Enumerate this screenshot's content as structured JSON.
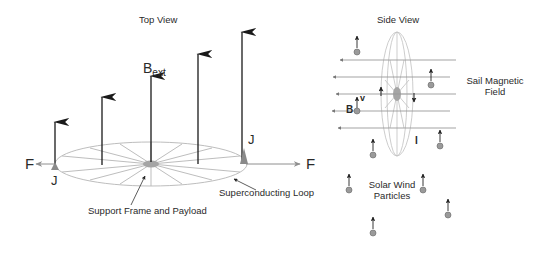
{
  "top_view": {
    "title": "Top View",
    "field_label_main": "B",
    "field_label_sub": "ext",
    "force_left": "F",
    "force_right": "F",
    "current_left": "J",
    "current_right": "J",
    "support_label": "Support Frame and Payload",
    "loop_label": "Superconducting Loop"
  },
  "side_view": {
    "title": "Side View",
    "field_label_line1": "Sail Magnetic",
    "field_label_line2": "Field",
    "particles_line1": "Solar Wind",
    "particles_line2": "Particles",
    "b_label": "B",
    "v_label": "v",
    "current_label": "I"
  },
  "colors": {
    "arrow_dark": "#1a1a1a",
    "loop_gray": "#b0b0b0",
    "field_line": "#9a9a9a",
    "particle_fill": "#9a9a9a",
    "hub_fill": "#a5a5a5"
  }
}
